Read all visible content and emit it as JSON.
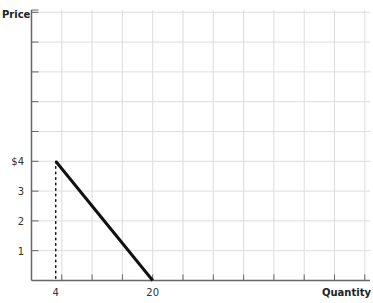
{
  "chart_data": {
    "type": "line",
    "title": "",
    "xlabel": "Quantity",
    "ylabel": "Price",
    "xlim": [
      0,
      55
    ],
    "ylim": [
      0,
      9
    ],
    "x_tick_labels": [
      {
        "value": 4,
        "label": "4"
      },
      {
        "value": 20,
        "label": "20"
      }
    ],
    "y_tick_labels": [
      {
        "value": 1,
        "label": "1"
      },
      {
        "value": 2,
        "label": "2"
      },
      {
        "value": 3,
        "label": "3"
      },
      {
        "value": 4,
        "label": "$4"
      }
    ],
    "grid": true,
    "x_grid_step": 5,
    "y_grid_step": 1,
    "series": [
      {
        "name": "demand",
        "style": "solid",
        "color": "#111111",
        "points": [
          {
            "x": 4,
            "y": 4
          },
          {
            "x": 20,
            "y": 0
          }
        ]
      },
      {
        "name": "guide",
        "style": "dotted",
        "color": "#111111",
        "points": [
          {
            "x": 4,
            "y": 4
          },
          {
            "x": 4,
            "y": 0
          }
        ]
      }
    ]
  },
  "colors": {
    "grid": "#dddddd",
    "axis": "#666666",
    "curve": "#111111"
  }
}
